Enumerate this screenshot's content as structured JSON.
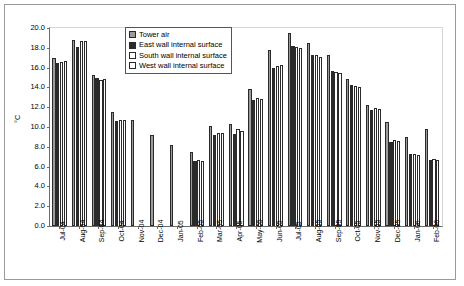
{
  "chart_data": {
    "type": "bar",
    "title": "",
    "xlabel": "",
    "ylabel": "°C",
    "ylim": [
      0.0,
      20.0
    ],
    "ytick_step": 2.0,
    "grid": false,
    "legend_position": "top-center",
    "ytick_labels": [
      "20.0",
      "18.0",
      "16.0",
      "14.0",
      "12.0",
      "10.0",
      "8.0",
      "6.0",
      "4.0",
      "2.0",
      "0.0"
    ],
    "categories": [
      "Jul-04",
      "Aug-04",
      "Sep-04",
      "Oct-04",
      "Nov-04",
      "Dec-04",
      "Jan-05",
      "Feb-05",
      "Mar-05",
      "Apr-05",
      "May-05",
      "Jun-05",
      "Jul-05",
      "Aug-05",
      "Sep-05",
      "Oct-05",
      "Nov-05",
      "Dec-05",
      "Jan-06",
      "Feb-06"
    ],
    "series": [
      {
        "name": "Tower air",
        "color": "#9c9c9c",
        "values": [
          17.0,
          18.8,
          15.3,
          11.5,
          10.7,
          9.2,
          8.2,
          7.5,
          10.1,
          10.3,
          13.8,
          17.8,
          19.5,
          18.5,
          17.3,
          14.8,
          12.2,
          10.5,
          9.0,
          9.8
        ]
      },
      {
        "name": "East wall internal surface",
        "color": "#2b2b2b",
        "values": [
          16.5,
          18.1,
          15.0,
          10.6,
          null,
          null,
          null,
          6.6,
          9.2,
          9.3,
          12.7,
          16.0,
          18.2,
          17.3,
          15.7,
          14.2,
          11.7,
          8.5,
          7.3,
          6.7
        ]
      },
      {
        "name": "South wall internal surface",
        "color": "#ffffff",
        "values": [
          16.6,
          18.7,
          14.7,
          10.7,
          null,
          null,
          null,
          6.7,
          9.4,
          9.8,
          12.9,
          16.2,
          18.1,
          17.3,
          15.6,
          14.1,
          11.9,
          8.7,
          7.3,
          6.8
        ]
      },
      {
        "name": "West wall internal surface",
        "color": "#ffffff",
        "values": [
          16.7,
          18.7,
          14.8,
          10.7,
          null,
          null,
          null,
          6.6,
          9.4,
          9.6,
          12.8,
          16.3,
          18.0,
          17.1,
          15.5,
          14.0,
          11.8,
          8.6,
          7.2,
          6.7
        ]
      }
    ]
  }
}
